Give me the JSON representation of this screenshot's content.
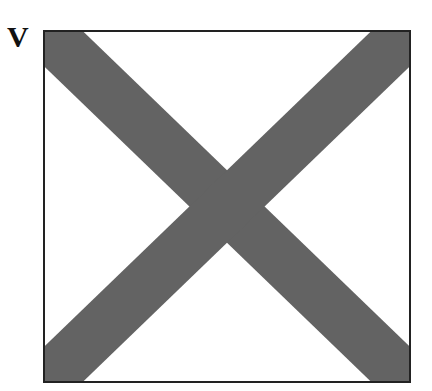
{
  "figure": {
    "label": "V",
    "shape": "diagonal-cross-in-square",
    "colors": {
      "stripe": "#636363",
      "border": "#222222",
      "background": "#ffffff"
    }
  }
}
